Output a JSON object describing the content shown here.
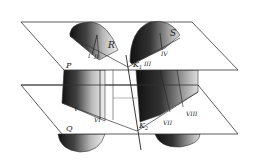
{
  "figure": {
    "planes": {
      "upper": {
        "label": "P"
      },
      "lower": {
        "label": "Q"
      }
    },
    "surfaces": {
      "left": {
        "label": "R"
      },
      "right": {
        "label": "S"
      }
    },
    "points": {
      "k1": {
        "label": "K",
        "sub": "1"
      },
      "k2": {
        "label": "K",
        "sub": "2"
      }
    },
    "roman_labels": {
      "i": "I",
      "ii": "II",
      "iii": "III",
      "iv": "IV",
      "v": "V",
      "vi": "VI",
      "vii": "VII",
      "viii": "VIII"
    },
    "colors": {
      "line": "#333333",
      "plane_fill": "#ffffff",
      "shade_dark": "#1a1a1a",
      "shade_light": "#e6e6e6"
    }
  }
}
